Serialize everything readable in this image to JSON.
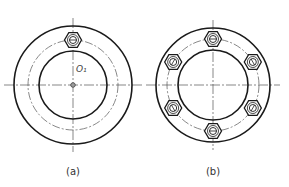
{
  "figures": [
    {
      "id": "a",
      "label": "(a)",
      "center_label": "O₁",
      "center": [
        73,
        85
      ],
      "outer_r": 59,
      "pitch_r": 45,
      "inner_r": 34,
      "bolt_count": 1,
      "bolt_angles": [
        -90
      ]
    },
    {
      "id": "b",
      "label": "(b)",
      "center": [
        213,
        85
      ],
      "outer_r": 57,
      "pitch_r": 46,
      "inner_r": 35,
      "bolt_count": 6,
      "bolt_angles": [
        -90,
        -30,
        30,
        90,
        150,
        210
      ]
    }
  ],
  "colors": {
    "line": "#1a1a1a",
    "thin": "#555555",
    "background": "#ffffff"
  }
}
